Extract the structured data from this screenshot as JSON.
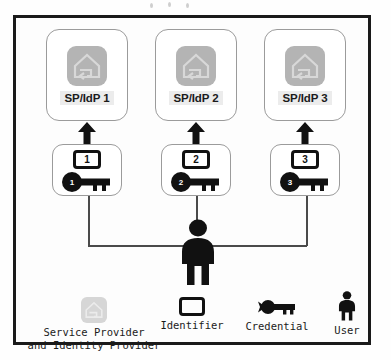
{
  "diagram": {
    "providers": [
      {
        "name": "sp-idp-1",
        "label": "SP/IdP 1"
      },
      {
        "name": "sp-idp-2",
        "label": "SP/IdP 2"
      },
      {
        "name": "sp-idp-3",
        "label": "SP/IdP 3"
      }
    ],
    "credentials": [
      {
        "identifier": "1",
        "key": "1"
      },
      {
        "identifier": "2",
        "key": "2"
      },
      {
        "identifier": "3",
        "key": "3"
      }
    ],
    "user": {
      "label": "",
      "icon": "user-icon"
    }
  },
  "legend": {
    "items": [
      {
        "icon": "service-provider-icon",
        "label_line1": "Service Provider",
        "label_line2": "and Identity Provider"
      },
      {
        "icon": "identifier-icon",
        "label_line1": "Identifier",
        "label_line2": ""
      },
      {
        "icon": "credential-key-icon",
        "label_line1": "Credential",
        "label_line2": ""
      },
      {
        "icon": "user-icon",
        "label_line1": "User",
        "label_line2": ""
      }
    ]
  },
  "colors": {
    "frame_border": "#1a1a1a",
    "box_border": "#9b9b9b",
    "icon_gray": "#b4b4b4",
    "ink": "#111111",
    "label_highlight": "#ececec",
    "line": "#4a4a4a"
  }
}
